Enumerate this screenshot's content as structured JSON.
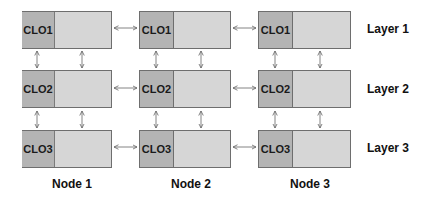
{
  "diagram": {
    "nodes": [
      {
        "label": "Node 1"
      },
      {
        "label": "Node 2"
      },
      {
        "label": "Node 3"
      }
    ],
    "layers": [
      {
        "label": "Layer 1",
        "clo": "CLO1"
      },
      {
        "label": "Layer 2",
        "clo": "CLO2"
      },
      {
        "label": "Layer 3",
        "clo": "CLO3"
      }
    ],
    "colors": {
      "clo_fill": "#b4b4b4",
      "main_fill": "#d6d6d6",
      "border": "#6e6e6e",
      "arrow": "#666666"
    }
  }
}
